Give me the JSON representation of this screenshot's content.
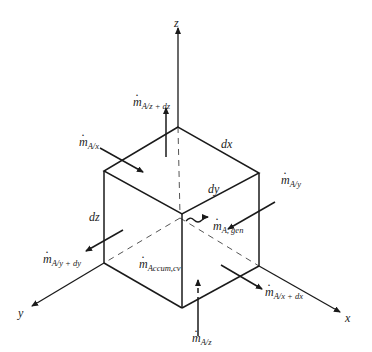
{
  "diagram": {
    "type": "differential control volume for mass transfer",
    "axes": {
      "x": "x",
      "y": "y",
      "z": "z"
    },
    "dimensions": {
      "dx": "dx",
      "dy": "dy",
      "dz": "dz"
    },
    "flows": {
      "in_x": {
        "symbol": "m",
        "sub": "A/x"
      },
      "out_x": {
        "symbol": "m",
        "sub": "A/x + dx"
      },
      "in_y": {
        "symbol": "m",
        "sub": "A/y"
      },
      "out_y": {
        "symbol": "m",
        "sub": "A/y + dy"
      },
      "in_z": {
        "symbol": "m",
        "sub": "A/z"
      },
      "out_z": {
        "symbol": "m",
        "sub": "A/z + dz"
      },
      "generation": {
        "symbol": "m",
        "sub": "A, gen"
      },
      "accumulation": {
        "symbol": "m",
        "sub": "Accum,cv"
      }
    },
    "colors": {
      "line": "#1a1a1a",
      "background": "#ffffff"
    }
  }
}
